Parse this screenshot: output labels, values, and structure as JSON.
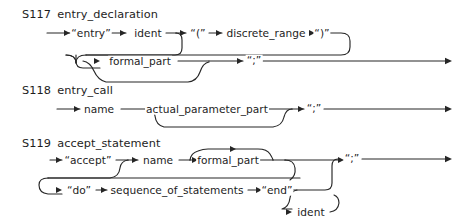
{
  "page": {
    "kind": "railroad-syntax-diagrams",
    "background_color": "#ffffff",
    "ink_color": "#262626",
    "width": 462,
    "height": 223
  },
  "diagrams": [
    {
      "id": "S117",
      "rule_name": "entry_declaration",
      "label_x": 22,
      "label_y": 8,
      "nodes": [
        {
          "name": "entry-terminal",
          "text": "“entry”",
          "kind": "terminal",
          "x": 91,
          "y": 33
        },
        {
          "name": "ident-nonterminal",
          "text": "ident",
          "kind": "nonterminal",
          "x": 148,
          "y": 33
        },
        {
          "name": "open-paren-terminal",
          "text": "“(”",
          "kind": "terminal",
          "x": 198,
          "y": 33
        },
        {
          "name": "discrete-range-nonterminal",
          "text": "discrete_range",
          "kind": "nonterminal",
          "x": 266,
          "y": 33
        },
        {
          "name": "close-paren-terminal",
          "text": "“)”",
          "kind": "terminal",
          "x": 322,
          "y": 33
        },
        {
          "name": "formal-part-nonterminal",
          "text": "formal_part",
          "kind": "nonterminal",
          "x": 140,
          "y": 62
        },
        {
          "name": "semicolon-terminal",
          "text": "“;”",
          "kind": "terminal",
          "x": 254,
          "y": 61
        }
      ]
    },
    {
      "id": "S118",
      "rule_name": "entry_call",
      "label_x": 22,
      "label_y": 84,
      "nodes": [
        {
          "name": "name-nonterminal",
          "text": "name",
          "kind": "nonterminal",
          "x": 99,
          "y": 109
        },
        {
          "name": "actual-parameter-part-nonterminal",
          "text": "actual_parameter_part",
          "kind": "nonterminal",
          "x": 207,
          "y": 109
        },
        {
          "name": "semicolon-terminal",
          "text": "“;”",
          "kind": "terminal",
          "x": 314,
          "y": 108
        }
      ]
    },
    {
      "id": "S119",
      "rule_name": "accept_statement",
      "label_x": 22,
      "label_y": 137,
      "nodes": [
        {
          "name": "accept-terminal",
          "text": "“accept”",
          "kind": "terminal",
          "x": 88,
          "y": 160
        },
        {
          "name": "name-nonterminal",
          "text": "name",
          "kind": "nonterminal",
          "x": 158,
          "y": 160
        },
        {
          "name": "formal-part-nonterminal",
          "text": "formal_part",
          "kind": "nonterminal",
          "x": 228,
          "y": 160
        },
        {
          "name": "semicolon-terminal",
          "text": "“;”",
          "kind": "terminal",
          "x": 352,
          "y": 159
        },
        {
          "name": "do-terminal",
          "text": "“do”",
          "kind": "terminal",
          "x": 79,
          "y": 190
        },
        {
          "name": "sequence-of-statements-nonterminal",
          "text": "sequence_of_statements",
          "kind": "nonterminal",
          "x": 177,
          "y": 190
        },
        {
          "name": "end-terminal",
          "text": "“end”",
          "kind": "terminal",
          "x": 277,
          "y": 190
        },
        {
          "name": "ident-nonterminal",
          "text": "ident",
          "kind": "nonterminal",
          "x": 311,
          "y": 212
        }
      ]
    }
  ]
}
